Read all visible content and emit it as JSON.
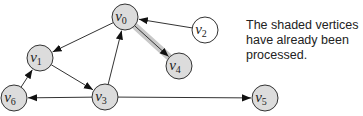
{
  "caption": {
    "lines": [
      "The shaded vertices",
      "have already been",
      "processed."
    ]
  },
  "colors": {
    "shaded_fill": "#dcdcdc",
    "unshaded_fill": "#ffffff",
    "stroke": "#333333",
    "highlight_edge": "#c8c8c8"
  },
  "graph": {
    "nodes": [
      {
        "id": "v0",
        "base": "v",
        "sub": "0",
        "x": 125,
        "y": 17,
        "shaded": true
      },
      {
        "id": "v1",
        "base": "v",
        "sub": "1",
        "x": 40,
        "y": 58,
        "shaded": true
      },
      {
        "id": "v2",
        "base": "v",
        "sub": "2",
        "x": 205,
        "y": 30,
        "shaded": false
      },
      {
        "id": "v3",
        "base": "v",
        "sub": "3",
        "x": 105,
        "y": 97,
        "shaded": true
      },
      {
        "id": "v4",
        "base": "v",
        "sub": "4",
        "x": 179,
        "y": 66,
        "shaded": true
      },
      {
        "id": "v5",
        "base": "v",
        "sub": "5",
        "x": 265,
        "y": 98,
        "shaded": true
      },
      {
        "id": "v6",
        "base": "v",
        "sub": "6",
        "x": 14,
        "y": 98,
        "shaded": true
      }
    ],
    "edges": [
      {
        "from": "v0",
        "to": "v1",
        "highlighted": false
      },
      {
        "from": "v2",
        "to": "v0",
        "highlighted": false
      },
      {
        "from": "v0",
        "to": "v4",
        "highlighted": true
      },
      {
        "from": "v1",
        "to": "v3",
        "highlighted": false
      },
      {
        "from": "v3",
        "to": "v0",
        "highlighted": false
      },
      {
        "from": "v6",
        "to": "v1",
        "highlighted": false
      },
      {
        "from": "v3",
        "to": "v6",
        "highlighted": false
      },
      {
        "from": "v3",
        "to": "v5",
        "highlighted": false
      }
    ],
    "node_radius": 13
  }
}
